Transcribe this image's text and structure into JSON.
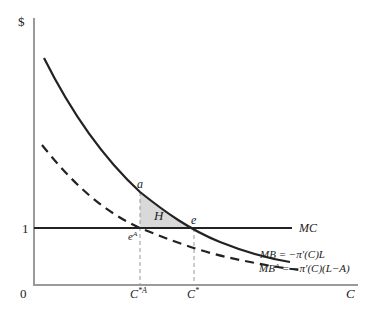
{
  "diagram": {
    "title": "",
    "y_axis_label": "$",
    "x_axis_label": "C",
    "origin_label": "0",
    "y_tick_label": "1",
    "x_tick_labels": [
      "C*A",
      "C*"
    ],
    "curves": [
      {
        "name": "MB",
        "label": "MB = −π′(C)L",
        "style": "solid"
      },
      {
        "name": "MBA",
        "label": "MBA = −π′(C)(L−A)",
        "style": "dashed"
      },
      {
        "name": "MC",
        "label": "MC",
        "style": "solid",
        "value": 1
      }
    ],
    "points": {
      "a": "a",
      "e": "e",
      "eA": "eA"
    },
    "region_label": "H",
    "colors": {
      "curve": "#222222",
      "axis": "#999999",
      "shade": "#d9d9d9",
      "guide": "#999999"
    }
  }
}
